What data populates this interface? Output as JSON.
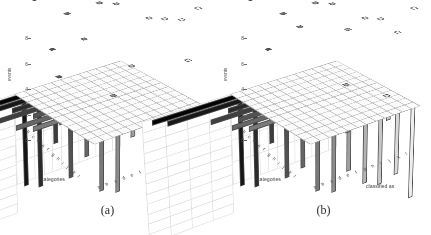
{
  "figure": {
    "panels": [
      {
        "id": "a",
        "caption": "(a)",
        "axis": {
          "ylabel": "events",
          "yticks": [
            "0",
            "2",
            "4",
            "6",
            "8"
          ],
          "ylim": [
            0,
            8
          ],
          "xlabel": "classified as",
          "zlabel": "categories",
          "xticks": [
            "a",
            "b",
            "c",
            "d",
            "e",
            "f",
            "g",
            "h",
            "i",
            "j",
            "k",
            "l"
          ],
          "zticks": [
            "a",
            "b",
            "c",
            "d",
            "e",
            "f",
            "g",
            "h",
            "i",
            "j",
            "k",
            "l"
          ]
        }
      },
      {
        "id": "b",
        "caption": "(b)",
        "axis": {
          "ylabel": "events",
          "yticks": [
            "0",
            "2",
            "4",
            "6",
            "8"
          ],
          "ylim": [
            0,
            8
          ],
          "xlabel": "classified as",
          "zlabel": "categories",
          "xticks": [
            "a",
            "b",
            "c",
            "d",
            "e",
            "f",
            "g",
            "h",
            "i",
            "j",
            "k",
            "l"
          ],
          "zticks": [
            "a",
            "b",
            "c",
            "d",
            "e",
            "f",
            "g",
            "h",
            "i",
            "j",
            "k",
            "l"
          ]
        }
      }
    ]
  },
  "chart_data": [
    {
      "type": "bar",
      "title": "(a)",
      "subtitle": "",
      "xlabel": "classified as",
      "ylabel": "events",
      "zlabel": "categories",
      "ylim": [
        0,
        8
      ],
      "grid": true,
      "legend": "none",
      "projection": "3d",
      "categories": [
        "a",
        "b",
        "c",
        "d",
        "e",
        "f",
        "g",
        "h",
        "i",
        "j",
        "k",
        "l"
      ],
      "classified_as": [
        "a",
        "b",
        "c",
        "d",
        "e",
        "f",
        "g",
        "h",
        "i",
        "j",
        "k",
        "l"
      ],
      "matrix": [
        [
          8,
          0,
          0,
          0,
          0,
          0,
          0,
          0,
          0,
          0,
          0,
          0
        ],
        [
          0,
          8,
          0,
          0,
          0,
          0,
          0,
          0,
          0,
          0,
          0,
          0
        ],
        [
          0,
          0,
          4,
          0,
          0,
          0,
          0,
          0,
          0,
          0,
          0,
          0
        ],
        [
          0,
          0,
          2,
          7,
          0,
          0,
          0,
          0,
          0,
          0,
          0,
          0
        ],
        [
          0,
          0,
          0,
          0,
          5,
          0,
          0,
          0,
          0,
          0,
          0,
          0
        ],
        [
          0,
          0,
          0,
          0,
          0,
          8,
          0,
          0,
          0,
          0,
          0,
          0
        ],
        [
          0,
          0,
          0,
          0,
          0,
          0,
          8,
          0,
          0,
          0,
          0,
          0
        ],
        [
          0,
          0,
          0,
          0,
          0,
          1,
          0,
          3,
          0,
          0,
          0,
          0
        ],
        [
          0,
          0,
          0,
          0,
          0,
          0,
          0,
          0,
          7,
          0,
          0,
          0
        ],
        [
          0,
          0,
          0,
          0,
          0,
          0,
          0,
          0,
          0,
          7,
          0,
          0
        ],
        [
          0,
          0,
          0,
          0,
          0,
          0,
          0,
          0,
          0,
          0,
          7,
          0
        ],
        [
          0,
          0,
          0,
          0,
          0,
          0,
          0,
          0,
          0,
          0,
          4,
          8
        ]
      ]
    },
    {
      "type": "bar",
      "title": "(b)",
      "subtitle": "",
      "xlabel": "classified as",
      "ylabel": "events",
      "zlabel": "categories",
      "ylim": [
        0,
        8
      ],
      "grid": true,
      "legend": "none",
      "projection": "3d",
      "categories": [
        "a",
        "b",
        "c",
        "d",
        "e",
        "f",
        "g",
        "h",
        "i",
        "j",
        "k",
        "l"
      ],
      "classified_as": [
        "a",
        "b",
        "c",
        "d",
        "e",
        "f",
        "g",
        "h",
        "i",
        "j",
        "k",
        "l"
      ],
      "matrix": [
        [
          8,
          0,
          0,
          0,
          0,
          0,
          0,
          0,
          0,
          0,
          0,
          0
        ],
        [
          0,
          8,
          0,
          0,
          0,
          0,
          0,
          0,
          0,
          0,
          0,
          0
        ],
        [
          0,
          0,
          4,
          0,
          0,
          0,
          0,
          0,
          0,
          0,
          0,
          0
        ],
        [
          0,
          0,
          0,
          7,
          0,
          0,
          0,
          0,
          0,
          0,
          0,
          0
        ],
        [
          0,
          0,
          0,
          0,
          6,
          0,
          0,
          0,
          0,
          0,
          0,
          0
        ],
        [
          0,
          0,
          0,
          0,
          0,
          8,
          0,
          0,
          0,
          0,
          0,
          0
        ],
        [
          0,
          0,
          0,
          0,
          0,
          0,
          8,
          0,
          0,
          0,
          0,
          0
        ],
        [
          0,
          0,
          0,
          0,
          0,
          0,
          0,
          6,
          0,
          0,
          0,
          0
        ],
        [
          0,
          0,
          0,
          0,
          0,
          0,
          2,
          0,
          7,
          0,
          0,
          0
        ],
        [
          0,
          0,
          0,
          0,
          0,
          0,
          0,
          0,
          0,
          7,
          0,
          0
        ],
        [
          0,
          0,
          0,
          0,
          0,
          0,
          0,
          0,
          0,
          1,
          6,
          0
        ],
        [
          0,
          0,
          0,
          0,
          0,
          0,
          0,
          0,
          0,
          0,
          0,
          8
        ]
      ]
    }
  ],
  "style": {
    "background": "#ffffff",
    "gridline": "#9a9a9a",
    "wall_gridline": "#dcdcdc",
    "edge": "#4a4a4a",
    "text": "#3f3f3f"
  }
}
